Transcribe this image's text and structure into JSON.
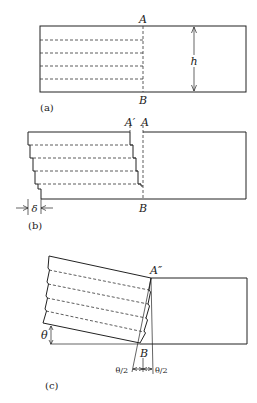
{
  "figure": {
    "panels": [
      {
        "id": "a",
        "caption": "(a)",
        "labels": {
          "top": "A",
          "bottom": "B",
          "height": "h"
        },
        "description": "Undeformed block with layered planes; dashed section line AB"
      },
      {
        "id": "b",
        "caption": "(b)",
        "labels": {
          "top_shifted": "A′",
          "top": "A",
          "bottom": "B",
          "displacement": "δ"
        },
        "description": "Layers slipped producing stepped edges; displacement δ"
      },
      {
        "id": "c",
        "caption": "(c)",
        "labels": {
          "top": "A″",
          "bottom": "B",
          "angle": "θ",
          "half_angle_left": "θ/2",
          "half_angle_right": "θ/2"
        },
        "description": "Rotated block (kink) with angle θ; boundary bisects into θ/2 halves"
      }
    ]
  }
}
